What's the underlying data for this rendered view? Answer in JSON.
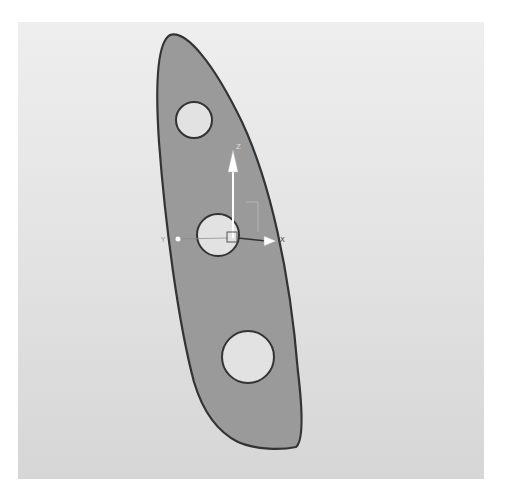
{
  "viewport": {
    "background_top": "#eeeeee",
    "background_bottom": "#d6d6d6"
  },
  "part": {
    "name": "tapered plate with three holes",
    "fill": "#9a9a9a",
    "outline": "#333333",
    "hole_fill": "#e2e2e2",
    "holes": [
      {
        "name": "top-hole",
        "cx": 176,
        "cy": 98,
        "r": 18
      },
      {
        "name": "center-hole",
        "cx": 200,
        "cy": 213,
        "r": 21
      },
      {
        "name": "bottom-hole",
        "cx": 230,
        "cy": 335,
        "r": 26
      }
    ]
  },
  "triad": {
    "x_label": "X",
    "y_label": "Y",
    "z_label": "Z",
    "color": "#ffffff"
  }
}
